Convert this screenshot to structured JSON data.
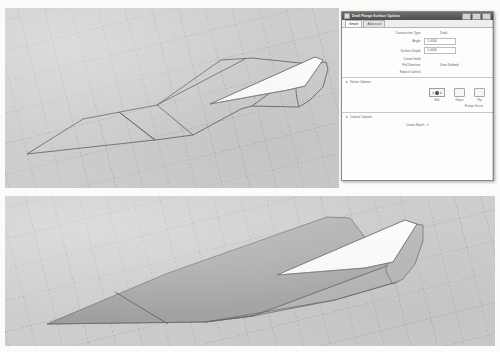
{
  "document": {
    "background_color": "#fbfbfa",
    "viewport_background": "#cdcdcb"
  },
  "viewports": [
    {
      "name": "wireframe-view",
      "display_mode": "Wireframe",
      "description": "Hull / fuselage wireframe with white draft flange surface at tail"
    },
    {
      "name": "shaded-view",
      "display_mode": "Shaded",
      "description": "Same hull shaded grey with white draft flange surface at tail"
    }
  ],
  "dialog": {
    "title": "Draft Flange Surface Options",
    "icon": "window-icon",
    "titlebar_buttons": [
      "minimize",
      "maximize",
      "close"
    ],
    "tabs": [
      {
        "label": "Simple",
        "active": true
      },
      {
        "label": "Advanced",
        "active": false
      }
    ],
    "parameters": [
      {
        "label": "Construction Type",
        "value": "Draft",
        "kind": "plain"
      },
      {
        "label": "Angle",
        "value": "1.0000",
        "kind": "field"
      },
      {
        "label": "Surface Depth",
        "value": "1.0000",
        "kind": "field"
      },
      {
        "label": "Create Solid",
        "value": "",
        "kind": "plain"
      },
      {
        "label": "Pull Direction",
        "value": "User Defined",
        "kind": "plain"
      },
      {
        "label": "Explicit Control",
        "value": "",
        "kind": "plain"
      }
    ],
    "sections": [
      {
        "name": "vector-options",
        "title": "Vector Options",
        "expanded": true,
        "buttons": [
          {
            "label": "Edit"
          },
          {
            "label": "Reject"
          },
          {
            "label": "Flip"
          }
        ],
        "extra_label": "Prompt Vector"
      },
      {
        "name": "control-options",
        "title": "Control Options",
        "expanded": true,
        "checkbox": {
          "label": "Create Notch",
          "checked": true
        }
      }
    ]
  }
}
